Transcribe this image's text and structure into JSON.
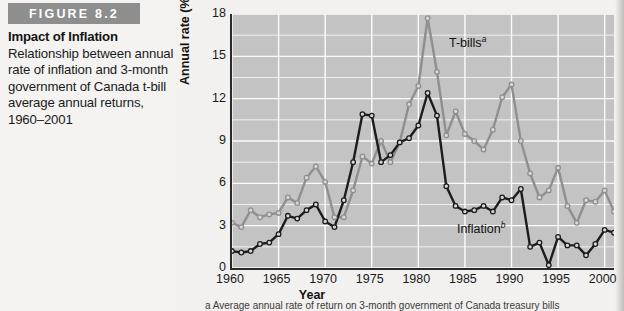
{
  "figure": {
    "badge": "FIGURE 8.2",
    "title": "Impact of Inflation",
    "description": "Relationship between annual rate of inflation and 3-month government of Canada t-bill average annual returns, 1960–2001",
    "footnote": "a Average annual rate of return on 3-month government of Canada treasury bills"
  },
  "colors": {
    "badge_bg": "#8e8e8e",
    "plot_bg": "#c3c3c3",
    "grid": "#ffffff",
    "axis": "#2b2b2b",
    "tbills_line": "#8f8f8f",
    "inflation_line": "#1c1c1c",
    "marker_fill": "#d8d8d8"
  },
  "chart_data": {
    "type": "line",
    "title": "Impact of Inflation",
    "xlabel": "Year",
    "ylabel": "Annual rate (%)",
    "xlim": [
      1960,
      2001
    ],
    "ylim": [
      0,
      18
    ],
    "yticks": [
      0,
      3,
      6,
      9,
      12,
      15,
      18
    ],
    "xticks": [
      1960,
      1965,
      1970,
      1975,
      1980,
      1985,
      1990,
      1995,
      2000
    ],
    "minor_gridlines": true,
    "grid": true,
    "legend_position": "inline-annotations",
    "x": [
      1960,
      1961,
      1962,
      1963,
      1964,
      1965,
      1966,
      1967,
      1968,
      1969,
      1970,
      1971,
      1972,
      1973,
      1974,
      1975,
      1976,
      1977,
      1978,
      1979,
      1980,
      1981,
      1982,
      1983,
      1984,
      1985,
      1986,
      1987,
      1988,
      1989,
      1990,
      1991,
      1992,
      1993,
      1994,
      1995,
      1996,
      1997,
      1998,
      1999,
      2000,
      2001
    ],
    "series": [
      {
        "name": "T-bills",
        "annotation": "T-bills",
        "annotation_superscript": "a",
        "color": "#8f8f8f",
        "values": [
          3.2,
          2.9,
          4.1,
          3.6,
          3.8,
          3.9,
          5.0,
          4.6,
          6.4,
          7.2,
          6.1,
          3.6,
          3.6,
          5.5,
          7.9,
          7.4,
          9.0,
          7.5,
          8.9,
          11.6,
          12.9,
          17.7,
          13.9,
          9.4,
          11.1,
          9.5,
          9.0,
          8.4,
          9.8,
          12.1,
          13.0,
          9.0,
          6.7,
          5.0,
          5.5,
          7.1,
          4.4,
          3.2,
          4.8,
          4.7,
          5.5,
          4.0
        ]
      },
      {
        "name": "Inflation",
        "annotation": "Inflation",
        "annotation_superscript": "b",
        "color": "#1c1c1c",
        "values": [
          1.2,
          1.1,
          1.2,
          1.7,
          1.8,
          2.4,
          3.7,
          3.5,
          4.1,
          4.5,
          3.3,
          2.9,
          4.8,
          7.5,
          10.9,
          10.8,
          7.5,
          8.0,
          8.9,
          9.2,
          10.1,
          12.4,
          10.8,
          5.8,
          4.4,
          4.0,
          4.1,
          4.4,
          4.0,
          5.0,
          4.8,
          5.6,
          1.5,
          1.8,
          0.2,
          2.2,
          1.6,
          1.6,
          0.9,
          1.7,
          2.7,
          2.5
        ]
      }
    ]
  }
}
